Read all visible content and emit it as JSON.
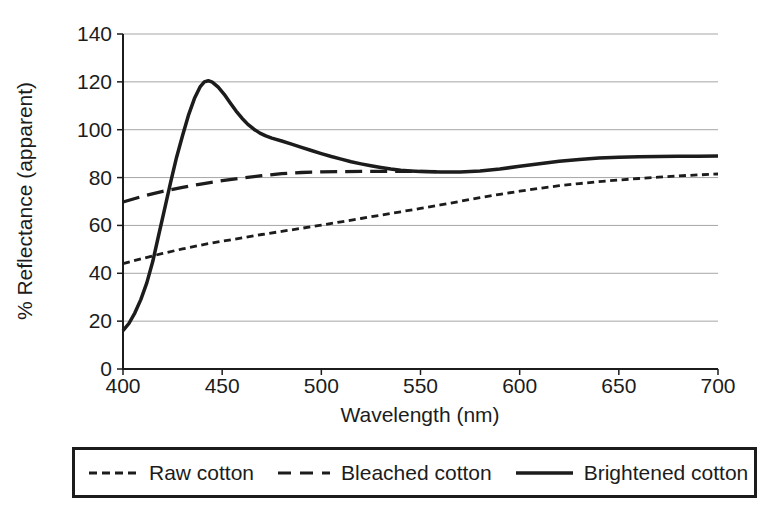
{
  "figure": {
    "background": "#ffffff",
    "ink_color": "#1c1c1c",
    "gridline_color": "#a6a6a6"
  },
  "chart_data": {
    "type": "line",
    "title": "",
    "xlabel": "Wavelength (nm)",
    "ylabel": "% Reflectance (apparent)",
    "xlim": [
      400,
      700
    ],
    "ylim": [
      0,
      140
    ],
    "xticks": [
      400,
      450,
      500,
      550,
      600,
      650,
      700
    ],
    "yticks": [
      0,
      20,
      40,
      60,
      80,
      100,
      120,
      140
    ],
    "grid": "horizontal",
    "legend_position": "bottom-box",
    "series": [
      {
        "name": "Raw cotton",
        "line_style": "dotted",
        "points": [
          [
            400,
            44
          ],
          [
            410,
            46.2
          ],
          [
            420,
            48.3
          ],
          [
            430,
            50.2
          ],
          [
            440,
            51.9
          ],
          [
            450,
            53.4
          ],
          [
            460,
            54.8
          ],
          [
            470,
            56.2
          ],
          [
            480,
            57.5
          ],
          [
            490,
            58.8
          ],
          [
            500,
            60.1
          ],
          [
            510,
            61.5
          ],
          [
            520,
            62.9
          ],
          [
            530,
            64.3
          ],
          [
            540,
            65.7
          ],
          [
            550,
            67.1
          ],
          [
            560,
            68.6
          ],
          [
            570,
            70.1
          ],
          [
            580,
            71.6
          ],
          [
            590,
            73
          ],
          [
            600,
            74.3
          ],
          [
            610,
            75.5
          ],
          [
            620,
            76.6
          ],
          [
            630,
            77.5
          ],
          [
            640,
            78.3
          ],
          [
            650,
            79
          ],
          [
            660,
            79.6
          ],
          [
            670,
            80.2
          ],
          [
            680,
            80.7
          ],
          [
            690,
            81.1
          ],
          [
            700,
            81.5
          ]
        ]
      },
      {
        "name": "Bleached cotton",
        "line_style": "dashed",
        "points": [
          [
            400,
            69.8
          ],
          [
            410,
            72.2
          ],
          [
            420,
            74.2
          ],
          [
            430,
            75.9
          ],
          [
            440,
            77.4
          ],
          [
            450,
            78.7
          ],
          [
            460,
            79.8
          ],
          [
            470,
            80.8
          ],
          [
            480,
            81.6
          ],
          [
            490,
            82.1
          ],
          [
            500,
            82.4
          ],
          [
            510,
            82.5
          ],
          [
            520,
            82.6
          ],
          [
            530,
            82.6
          ],
          [
            540,
            82.6
          ],
          [
            550,
            82.6
          ],
          [
            558,
            82.5
          ]
        ]
      },
      {
        "name": "Brightened cotton",
        "line_style": "solid",
        "points": [
          [
            400,
            16
          ],
          [
            403,
            19
          ],
          [
            406,
            23.5
          ],
          [
            409,
            29
          ],
          [
            412,
            36
          ],
          [
            415,
            45
          ],
          [
            418,
            56
          ],
          [
            421,
            67
          ],
          [
            424,
            78
          ],
          [
            427,
            88.5
          ],
          [
            430,
            97.5
          ],
          [
            433,
            106
          ],
          [
            436,
            113
          ],
          [
            439,
            118
          ],
          [
            441,
            120
          ],
          [
            443,
            120.5
          ],
          [
            445,
            119.9
          ],
          [
            448,
            117.8
          ],
          [
            451,
            114.8
          ],
          [
            454,
            111.3
          ],
          [
            457,
            107.8
          ],
          [
            460,
            104.8
          ],
          [
            463,
            102.2
          ],
          [
            466,
            100.2
          ],
          [
            469,
            98.6
          ],
          [
            472,
            97.4
          ],
          [
            475,
            96.5
          ],
          [
            480,
            95.3
          ],
          [
            485,
            94
          ],
          [
            490,
            92.6
          ],
          [
            495,
            91.3
          ],
          [
            500,
            90
          ],
          [
            505,
            88.8
          ],
          [
            510,
            87.7
          ],
          [
            515,
            86.6
          ],
          [
            520,
            85.7
          ],
          [
            525,
            84.9
          ],
          [
            530,
            84.2
          ],
          [
            535,
            83.6
          ],
          [
            540,
            83.1
          ],
          [
            545,
            82.8
          ],
          [
            550,
            82.6
          ],
          [
            555,
            82.4
          ],
          [
            560,
            82.3
          ],
          [
            570,
            82.3
          ],
          [
            580,
            82.8
          ],
          [
            590,
            83.6
          ],
          [
            600,
            84.7
          ],
          [
            610,
            85.8
          ],
          [
            620,
            86.8
          ],
          [
            630,
            87.6
          ],
          [
            640,
            88.2
          ],
          [
            650,
            88.5
          ],
          [
            660,
            88.7
          ],
          [
            670,
            88.8
          ],
          [
            680,
            88.9
          ],
          [
            690,
            88.9
          ],
          [
            700,
            89
          ]
        ]
      }
    ]
  }
}
